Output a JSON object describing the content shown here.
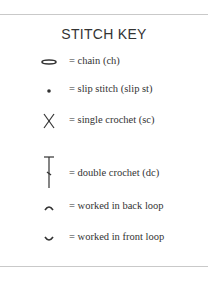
{
  "title": "STITCH KEY",
  "items": [
    {
      "icon": "chain-oval-icon",
      "label": "= chain (ch)"
    },
    {
      "icon": "slip-stitch-dot-icon",
      "label": "= slip stitch (slip st)"
    },
    {
      "icon": "single-crochet-x-icon",
      "label": "= single crochet (sc)"
    },
    {
      "icon": "double-crochet-t-icon",
      "label": "= double crochet (dc)"
    },
    {
      "icon": "back-loop-arc-icon",
      "label": "= worked in back loop"
    },
    {
      "icon": "front-loop-arc-icon",
      "label": "= worked in front loop"
    }
  ],
  "colors": {
    "text": "#333333",
    "rule": "#c9c9c9"
  }
}
